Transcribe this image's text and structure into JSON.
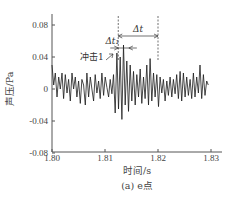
{
  "chart_data": {
    "type": "line",
    "title": "",
    "caption": "(a) e点",
    "xlabel": "时间/s",
    "ylabel": "声压/Pa",
    "xlim": [
      1.8,
      1.833
    ],
    "ylim": [
      -0.08,
      0.095
    ],
    "xticks": [
      1.8,
      1.81,
      1.82,
      1.83
    ],
    "xtick_labels": [
      "1.80",
      "1.81",
      "1.82",
      "1.83"
    ],
    "yticks": [
      0.08,
      0.04,
      0,
      -0.04,
      -0.08
    ],
    "ytick_labels": [
      "0.08",
      "0.04",
      "0",
      "-0.04",
      "-0.08"
    ],
    "grid": false,
    "legend": null,
    "series": [
      {
        "name": "声压",
        "color": "#1a1a1a",
        "x_start": 1.8,
        "x_end": 1.8295,
        "values": [
          0.03,
          0.005,
          0.02,
          -0.01,
          0.015,
          0.0,
          0.02,
          -0.012,
          0.018,
          -0.005,
          0.012,
          -0.015,
          0.02,
          0.0,
          0.015,
          -0.01,
          0.01,
          -0.018,
          0.012,
          0.005,
          -0.02,
          0.02,
          -0.01,
          0.015,
          0.0,
          -0.015,
          0.018,
          -0.005,
          0.01,
          -0.012,
          0.02,
          -0.008,
          0.015,
          0.002,
          -0.01,
          0.012,
          -0.006,
          0.018,
          -0.03,
          0.045,
          -0.025,
          0.04,
          -0.038,
          0.055,
          -0.02,
          0.035,
          -0.028,
          0.03,
          -0.015,
          0.022,
          -0.02,
          0.018,
          -0.01,
          0.025,
          -0.018,
          0.015,
          -0.012,
          0.03,
          -0.02,
          0.038,
          -0.015,
          0.02,
          -0.01,
          0.018,
          -0.022,
          0.015,
          -0.005,
          0.012,
          -0.015,
          0.01,
          -0.008,
          0.015,
          -0.01,
          0.012,
          -0.006,
          0.018,
          -0.012,
          0.022,
          -0.015,
          0.02,
          -0.01,
          0.015,
          -0.008,
          0.012,
          -0.012,
          0.02,
          -0.01,
          0.015,
          -0.005,
          0.03,
          -0.012,
          0.018,
          -0.008,
          0.01,
          0.005
        ]
      }
    ],
    "annotations": [
      {
        "text": "冲击1",
        "type": "arrow-label"
      },
      {
        "text": "Δt₁",
        "type": "interval",
        "from": 1.8125,
        "to": 1.8145
      },
      {
        "text": "Δt",
        "type": "interval",
        "from": 1.8125,
        "to": 1.82,
        "dashed_markers": true
      }
    ]
  }
}
